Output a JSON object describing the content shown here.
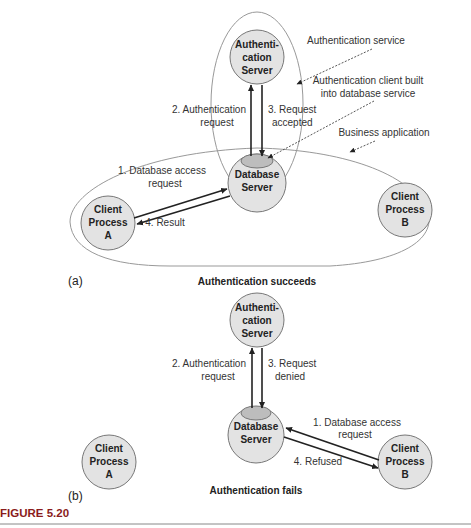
{
  "figure": {
    "label": "FIGURE 5.20",
    "accent_color": "#8a1c1c"
  },
  "panel_a": {
    "tag": "(a)",
    "caption": "Authentication succeeds",
    "nodes": {
      "auth_server": [
        "Authenti-",
        "cation",
        "Server"
      ],
      "db_server": [
        "Database",
        "Server"
      ],
      "client_a": [
        "Client",
        "Process",
        "A"
      ],
      "client_b": [
        "Client",
        "Process",
        "B"
      ]
    },
    "edges": {
      "auth_request": [
        "2. Authentication",
        "request"
      ],
      "request_result": [
        "3. Request",
        "accepted"
      ],
      "db_access": [
        "1. Database access",
        "request"
      ],
      "result": "4. Result"
    },
    "annotations": {
      "auth_service": "Authentication service",
      "auth_client": [
        "Authentication client built",
        "into database service"
      ],
      "business_app": "Business application"
    }
  },
  "panel_b": {
    "tag": "(b)",
    "caption": "Authentication fails",
    "nodes": {
      "auth_server": [
        "Authenti-",
        "cation",
        "Server"
      ],
      "db_server": [
        "Database",
        "Server"
      ],
      "client_a": [
        "Client",
        "Process",
        "A"
      ],
      "client_b": [
        "Client",
        "Process",
        "B"
      ]
    },
    "edges": {
      "auth_request": [
        "2. Authentication",
        "request"
      ],
      "request_result": [
        "3. Request",
        "denied"
      ],
      "db_access": [
        "1. Database access",
        "request"
      ],
      "result": "4. Refused"
    }
  },
  "colors": {
    "node_fill": "#e3e3e3",
    "node_stroke": "#777777",
    "client_tab_fill": "#bdbdbd",
    "line": "#222222",
    "enclosure": "#999999"
  }
}
